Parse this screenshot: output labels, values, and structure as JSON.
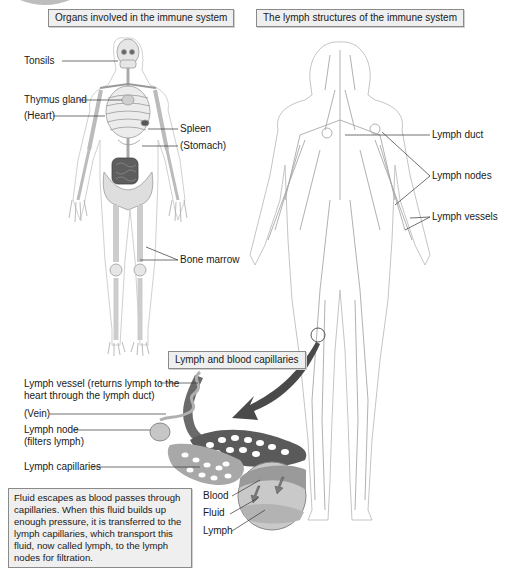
{
  "panels": {
    "organs": {
      "title": "Organs involved in the immune system",
      "labels": [
        {
          "id": "tonsils",
          "text": "Tonsils"
        },
        {
          "id": "thymus",
          "text": "Thymus gland"
        },
        {
          "id": "heart",
          "text": "(Heart)"
        },
        {
          "id": "spleen",
          "text": "Spleen"
        },
        {
          "id": "stomach",
          "text": "(Stomach)"
        },
        {
          "id": "bone_marrow",
          "text": "Bone marrow"
        }
      ]
    },
    "lymph_structures": {
      "title": "The lymph structures of the immune system",
      "labels": [
        {
          "id": "lymph_duct",
          "text": "Lymph duct"
        },
        {
          "id": "lymph_nodes",
          "text": "Lymph nodes"
        },
        {
          "id": "lymph_vessels",
          "text": "Lymph vessels"
        }
      ]
    },
    "capillaries": {
      "title": "Lymph and blood capillaries",
      "labels": [
        {
          "id": "lymph_vessel",
          "line1": "Lymph vessel (returns lymph to the",
          "line2": "heart through the lymph duct)"
        },
        {
          "id": "vein",
          "text": "(Vein)"
        },
        {
          "id": "lymph_node",
          "line1": "Lymph node",
          "line2": "(filters lymph)"
        },
        {
          "id": "lymph_capillaries",
          "text": "Lymph capillaries"
        },
        {
          "id": "blood",
          "text": "Blood"
        },
        {
          "id": "fluid",
          "text": "Fluid"
        },
        {
          "id": "lymph",
          "text": "Lymph"
        }
      ],
      "caption": "Fluid escapes as blood passes through capillaries. When this fluid builds up enough pressure, it is transferred to the lymph capillaries, which transport this fluid, now called lymph, to the lymph nodes for filtration."
    }
  },
  "colors": {
    "box_fill": "#efefef",
    "box_border": "#8a8a8a",
    "bone": "#e4e4e4",
    "bone_outline": "#9a9a9a",
    "organ_dark": "#5a5a5a",
    "lymph_line": "#a8a8a8",
    "arrow": "#4a4a4a"
  }
}
